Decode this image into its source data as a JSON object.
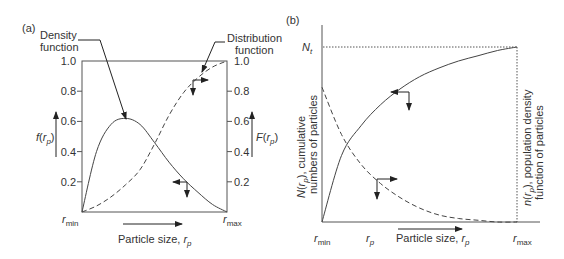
{
  "panel_a": {
    "tag": "(a)",
    "density_label": [
      "Density",
      "function"
    ],
    "distribution_label": [
      "Distribution",
      "function"
    ],
    "y_ticks": [
      "1.0",
      "0.8",
      "0.6",
      "0.4",
      "0.2"
    ],
    "left_axis_label": {
      "func": "f",
      "arg": "r",
      "sub": "p"
    },
    "right_axis_label": {
      "func": "F",
      "arg": "r",
      "sub": "p"
    },
    "x_min_label": {
      "var": "r",
      "sub": "min"
    },
    "x_max_label": {
      "var": "r",
      "sub": "max"
    },
    "x_axis_label": {
      "text": "Particle size, ",
      "var": "r",
      "sub": "p"
    }
  },
  "panel_b": {
    "tag": "(b)",
    "nt_label": {
      "var": "N",
      "sub": "t"
    },
    "left_axis_label": {
      "line1_func": "N",
      "line1_arg": "r",
      "line1_sub": "p",
      "line1_rest": ", cumulative",
      "line2": "numbers of particles"
    },
    "right_axis_label": {
      "line1_func": "n",
      "line1_arg": "r",
      "line1_sub": "p",
      "line1_rest": ", population density",
      "line2": "function of particles"
    },
    "x_min_label": {
      "var": "r",
      "sub": "min"
    },
    "x_mid_label": {
      "var": "r",
      "sub": "p"
    },
    "x_max_label": {
      "var": "r",
      "sub": "max"
    },
    "x_axis_label": {
      "text": "Particle size, ",
      "var": "r",
      "sub": "p"
    }
  },
  "chart_data": [
    {
      "type": "line",
      "title": "(a)",
      "xlabel": "Particle size, r_p",
      "ylabel_left": "f(r_p)",
      "ylabel_right": "F(r_p)",
      "x_ticks": [
        "r_min",
        "r_max"
      ],
      "y_ticks": [
        0.2,
        0.4,
        0.6,
        0.8,
        1.0
      ],
      "ylim": [
        0,
        1.0
      ],
      "series": [
        {
          "name": "Density function",
          "style": "solid",
          "x": [
            0,
            0.1,
            0.2,
            0.3,
            0.4,
            0.5,
            0.6,
            0.7,
            0.8,
            0.9,
            1.0
          ],
          "y": [
            0,
            0.4,
            0.58,
            0.62,
            0.58,
            0.46,
            0.33,
            0.22,
            0.13,
            0.05,
            0
          ]
        },
        {
          "name": "Distribution function",
          "style": "dashed",
          "x": [
            0,
            0.1,
            0.2,
            0.3,
            0.4,
            0.5,
            0.6,
            0.7,
            0.8,
            0.9,
            1.0
          ],
          "y": [
            0,
            0.04,
            0.1,
            0.18,
            0.28,
            0.45,
            0.64,
            0.79,
            0.89,
            0.96,
            1.0
          ]
        }
      ]
    },
    {
      "type": "line",
      "title": "(b)",
      "xlabel": "Particle size, r_p",
      "ylabel_left": "N(r_p), cumulative numbers of particles",
      "ylabel_right": "n(r_p), population density function of particles",
      "x_ticks": [
        "r_min",
        "r_p",
        "r_max"
      ],
      "y_ticks": [
        "N_t"
      ],
      "series": [
        {
          "name": "N(r_p) cumulative",
          "style": "solid",
          "x": [
            0,
            0.1,
            0.2,
            0.3,
            0.4,
            0.5,
            0.6,
            0.7,
            0.8,
            0.9,
            1.0
          ],
          "y": [
            0,
            0.38,
            0.55,
            0.67,
            0.76,
            0.83,
            0.88,
            0.92,
            0.95,
            0.98,
            1.0
          ]
        },
        {
          "name": "n(r_p) population density",
          "style": "dashed",
          "x": [
            0,
            0.1,
            0.2,
            0.3,
            0.4,
            0.5,
            0.6,
            0.7,
            0.8,
            0.9,
            1.0
          ],
          "y": [
            0.77,
            0.5,
            0.33,
            0.22,
            0.14,
            0.08,
            0.04,
            0.02,
            0.01,
            0.0,
            0.0
          ]
        }
      ]
    }
  ]
}
